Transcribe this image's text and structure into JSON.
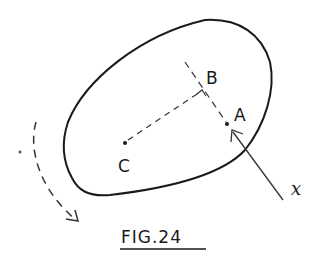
{
  "figure": {
    "caption": "FIG.24",
    "points": [
      {
        "id": "C",
        "label": "C"
      },
      {
        "id": "A",
        "label": "A"
      },
      {
        "id": "B",
        "label": "B"
      }
    ],
    "force_label": "x",
    "colors": {
      "ink": "#1a1a1a",
      "background": "#ffffff"
    }
  }
}
